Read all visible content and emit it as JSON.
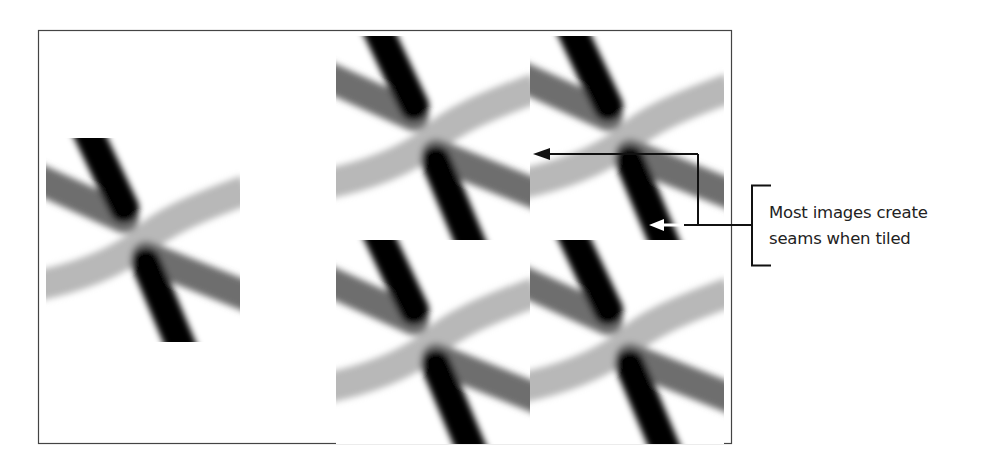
{
  "figure": {
    "frame": {
      "x": 38,
      "y": 30,
      "width": 694,
      "height": 414,
      "stroke": "#444444"
    },
    "single_tile": {
      "x": 46,
      "y": 140,
      "width": 194,
      "height": 200
    },
    "tiled_grid": {
      "rows": 2,
      "cols": 2,
      "origin_x": 336,
      "origin_y": 36,
      "tile_width": 194,
      "tile_height": 204
    },
    "colors": {
      "black_stroke": "#000000",
      "dark_gray_stroke": "#6a6a6a",
      "light_gray_stroke": "#b5b5b5",
      "arrow_black": "#111111",
      "arrow_white": "#ffffff"
    },
    "callout": {
      "lines": [
        "Most images create",
        "seams when tiled"
      ],
      "text_color": "#222222"
    }
  }
}
